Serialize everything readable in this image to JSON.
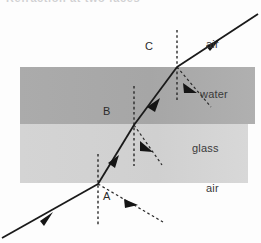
{
  "figure": {
    "title_fragment": "Refraction at two faces",
    "media": [
      {
        "name": "air",
        "label": "air",
        "position": "top",
        "label_x": 206,
        "label_y": 44
      },
      {
        "name": "water",
        "label": "water",
        "position": "middle",
        "label_x": 200,
        "label_y": 94
      },
      {
        "name": "glass",
        "label": "glass",
        "position": "lower",
        "label_x": 193,
        "label_y": 148
      },
      {
        "name": "air2",
        "label": "air",
        "position": "bottom",
        "label_x": 206,
        "label_y": 188
      }
    ],
    "points": [
      {
        "label": "A",
        "x": 98,
        "y": 184,
        "label_x": 104,
        "label_y": 191,
        "interface": "air-glass"
      },
      {
        "label": "B",
        "x": 134,
        "y": 125,
        "label_x": 104,
        "label_y": 106,
        "interface": "glass-water"
      },
      {
        "label": "C",
        "x": 177,
        "y": 67,
        "label_x": 146,
        "label_y": 41,
        "interface": "water-air"
      }
    ],
    "bands": {
      "water": {
        "x": 20,
        "y": 67,
        "width": 235,
        "height": 57,
        "color": "#a8a8a8"
      },
      "glass": {
        "x": 20,
        "y": 124,
        "width": 228,
        "height": 59,
        "color": "#d2d2d2"
      }
    },
    "colors": {
      "ray": "#1a1a1a",
      "normal": "#2a2a2a",
      "background": "#fdfdfd",
      "label_text": "#3a3a3a"
    },
    "ray_path": {
      "description": "incident ray from lower-left, refracting at A, B and C",
      "segments": [
        {
          "name": "incident-air",
          "x1": 2,
          "y1": 238,
          "x2": 98,
          "y2": 184
        },
        {
          "name": "refracted-glass",
          "x1": 98,
          "y1": 184,
          "x2": 134,
          "y2": 125
        },
        {
          "name": "refracted-water",
          "x1": 134,
          "y1": 125,
          "x2": 177,
          "y2": 67
        },
        {
          "name": "emergent-air",
          "x1": 177,
          "y1": 67,
          "x2": 256,
          "y2": 15
        }
      ]
    },
    "reflected_rays": [
      {
        "name": "reflected-at-A",
        "x1": 98,
        "y1": 184,
        "x2": 163,
        "y2": 222
      },
      {
        "name": "reflected-at-B",
        "x1": 134,
        "y1": 125,
        "x2": 162,
        "y2": 165
      },
      {
        "name": "reflected-at-C",
        "x1": 177,
        "y1": 67,
        "x2": 210,
        "y2": 106
      }
    ],
    "normals": [
      {
        "name": "normal-at-A",
        "x": 98,
        "y1": 154,
        "y2": 225
      },
      {
        "name": "normal-at-B",
        "x": 134,
        "y1": 86,
        "y2": 166
      },
      {
        "name": "normal-at-C",
        "x": 177,
        "y1": 30,
        "y2": 100
      }
    ]
  }
}
